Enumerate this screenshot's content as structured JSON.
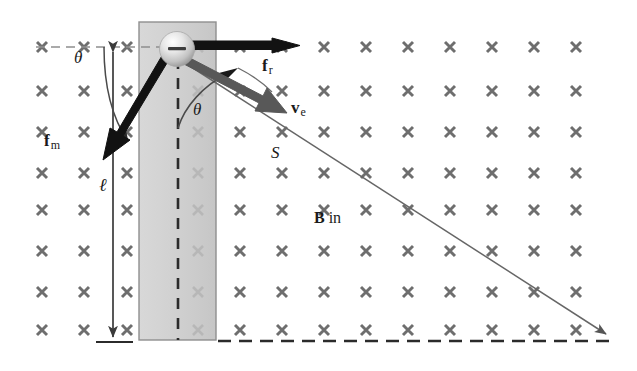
{
  "figure": {
    "background_color": "#ffffff",
    "width": 637,
    "height": 371
  },
  "field": {
    "symbol": "×",
    "label": "B in",
    "label_vector": "B",
    "label_rest": " in",
    "meaning": "magnetic-field-into-page",
    "marker_color": "#6e6e6e",
    "columns_x": [
      42,
      84,
      127,
      169,
      198,
      240,
      282,
      324,
      366,
      408,
      450,
      492,
      534,
      576
    ],
    "rows_y": [
      47,
      91,
      132,
      173,
      210,
      251,
      292,
      330
    ],
    "rows": 8,
    "columns": 14
  },
  "rod": {
    "name": "vertical-rod",
    "fill_color": "#d2d2d2",
    "stroke_color": "#8c8c8c",
    "x": 139,
    "y": 22,
    "width": 77,
    "height": 318
  },
  "pivot_axis": {
    "name": "vertical-dashed-axis",
    "color": "#2b2b2b",
    "x": 178,
    "y_top": 60,
    "y_bottom": 340
  },
  "horizontal_dashed_reference": {
    "name": "horizontal-dashed-reference",
    "color": "#8c8c8c",
    "y": 47,
    "x_start": 36,
    "x_end": 166
  },
  "baseline_dashed": {
    "name": "baseline-dashed",
    "color": "#2b2b2b",
    "y": 341,
    "x_start": 218,
    "x_end": 612
  },
  "sphere": {
    "name": "charged-sphere",
    "charge_symbol": "−",
    "charge_sign": "negative",
    "center_x": 177,
    "center_y": 49,
    "radius": 17,
    "highlight_color": "#fafafa",
    "body_color": "#c9c9c9"
  },
  "vectors": [
    {
      "id": "f_r",
      "label_vector": "f",
      "label_sub": "r",
      "name": "force-rod-vector",
      "meaning": "rod force on sphere",
      "color": "#111111",
      "style": "thick-black",
      "x1": 186,
      "y1": 45,
      "x2": 297,
      "y2": 45,
      "label_x": 262,
      "label_y": 58
    },
    {
      "id": "v_e",
      "label_vector": "v",
      "label_sub": "e",
      "name": "velocity-vector",
      "meaning": "velocity of sphere",
      "color": "#555555",
      "style": "thick-gray",
      "x1": 187,
      "y1": 59,
      "x2": 283,
      "y2": 110,
      "label_x": 292,
      "label_y": 100
    },
    {
      "id": "f_m",
      "label_vector": "f",
      "label_sub": "m",
      "name": "magnetic-force-vector",
      "meaning": "magnetic force on sphere",
      "color": "#111111",
      "style": "thick-black",
      "x1": 166,
      "y1": 61,
      "x2": 110,
      "y2": 158,
      "label_x": 44,
      "label_y": 133
    }
  ],
  "angles": [
    {
      "id": "theta-upper",
      "label": "θ",
      "name": "angle-theta-upper",
      "meaning": "angle between horizontal reference and magnetic force",
      "label_x": 80,
      "label_y": 52,
      "color": "#4a4a4a"
    },
    {
      "id": "theta-lower",
      "label": "θ",
      "name": "angle-theta-lower",
      "meaning": "angle between rod axis and velocity",
      "label_x": 196,
      "label_y": 103,
      "color": "#4a4a4a"
    }
  ],
  "length_measure": {
    "id": "ell",
    "label": "ℓ",
    "name": "rod-length-measure",
    "meaning": "length of rod from pivot to sphere",
    "color": "#3a3a3a",
    "x": 113,
    "y_top": 48,
    "y_bottom": 341,
    "label_x": 101,
    "label_y": 178
  },
  "trajectory": {
    "id": "S",
    "label": "S",
    "name": "trajectory-line",
    "meaning": "path / displacement line S",
    "color": "#666666",
    "x1": 182,
    "y1": 61,
    "x2": 609,
    "y2": 336,
    "label_x": 273,
    "label_y": 146
  }
}
